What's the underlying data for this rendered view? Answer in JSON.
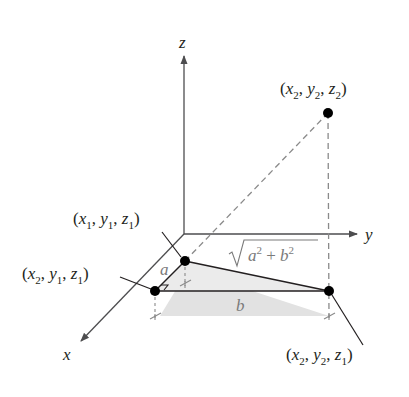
{
  "diagram": {
    "type": "3d-coordinate-distance",
    "axes": {
      "x_label": "x",
      "y_label": "y",
      "z_label": "z"
    },
    "points": [
      {
        "id": "p1",
        "label_var": [
          "x",
          "y",
          "z"
        ],
        "label_sub": [
          "1",
          "1",
          "1"
        ]
      },
      {
        "id": "p2",
        "label_var": [
          "x",
          "y",
          "z"
        ],
        "label_sub": [
          "2",
          "1",
          "1"
        ]
      },
      {
        "id": "p3",
        "label_var": [
          "x",
          "y",
          "z"
        ],
        "label_sub": [
          "2",
          "2",
          "1"
        ]
      },
      {
        "id": "p4",
        "label_var": [
          "x",
          "y",
          "z"
        ],
        "label_sub": [
          "2",
          "2",
          "2"
        ]
      }
    ],
    "segment_labels": {
      "a": "a",
      "b": "b",
      "hyp_a": "a",
      "hyp_b": "b",
      "hyp_exp": "2",
      "plus": "+"
    },
    "colors": {
      "axis": "#4d4d4f",
      "point": "#000000",
      "dashed": "#8a8a8a",
      "shade": "#dcdcdc",
      "gray_text": "#7a7a7a"
    }
  }
}
